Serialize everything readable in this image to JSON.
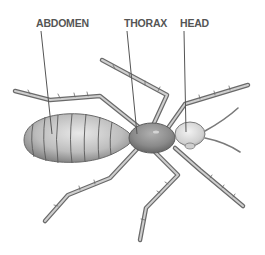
{
  "diagram": {
    "labels": {
      "abdomen": "ABDOMEN",
      "thorax": "THORAX",
      "head": "HEAD"
    },
    "colors": {
      "background": "#ffffff",
      "label_text": "#555555",
      "leader_line": "#555555",
      "body_dark": "#6e6e6e",
      "body_mid": "#a8a8a8",
      "body_light": "#e6e6e6",
      "leg_outline": "#6a6a6a",
      "leg_fill": "#c8c8c8"
    }
  }
}
